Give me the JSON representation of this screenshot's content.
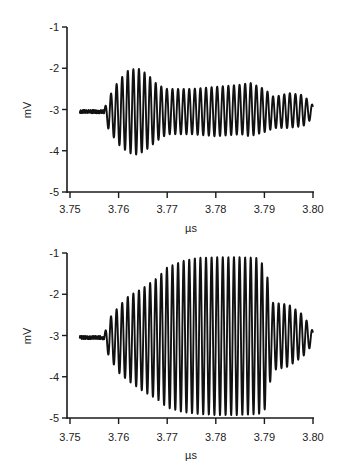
{
  "chart_data": [
    {
      "type": "line",
      "panel": "top",
      "title": "",
      "xlabel": "µs",
      "ylabel": "mV",
      "xlim": [
        3.75,
        3.8
      ],
      "ylim": [
        -5,
        -1
      ],
      "xticks": [
        "3.75",
        "3.76",
        "3.77",
        "3.78",
        "3.79",
        "3.80"
      ],
      "yticks": [
        "-1",
        "-2",
        "-3",
        "-4",
        "-5"
      ],
      "grid": false,
      "legend": null,
      "baseline_mV": -3.05,
      "signal_start_us": 3.752,
      "oscillation_start_us": 3.757,
      "signal_end_us": 3.8,
      "period_us": 0.00115,
      "envelope": {
        "t": [
          3.757,
          3.758,
          3.76,
          3.762,
          3.764,
          3.766,
          3.768,
          3.77,
          3.775,
          3.78,
          3.785,
          3.787,
          3.79,
          3.792,
          3.795,
          3.798,
          3.8
        ],
        "max": [
          -3.0,
          -2.7,
          -2.3,
          -2.05,
          -2.0,
          -2.15,
          -2.4,
          -2.5,
          -2.5,
          -2.45,
          -2.4,
          -2.35,
          -2.5,
          -2.7,
          -2.6,
          -2.65,
          -2.9
        ],
        "min": [
          -3.2,
          -3.5,
          -3.85,
          -4.05,
          -4.1,
          -3.95,
          -3.75,
          -3.6,
          -3.6,
          -3.65,
          -3.6,
          -3.65,
          -3.55,
          -3.45,
          -3.45,
          -3.4,
          -3.2
        ]
      }
    },
    {
      "type": "line",
      "panel": "bottom",
      "title": "",
      "xlabel": "µs",
      "ylabel": "mV",
      "xlim": [
        3.75,
        3.8
      ],
      "ylim": [
        -5,
        -1
      ],
      "xticks": [
        "3.75",
        "3.76",
        "3.77",
        "3.78",
        "3.79",
        "3.80"
      ],
      "yticks": [
        "-1",
        "-2",
        "-3",
        "-4",
        "-5"
      ],
      "grid": false,
      "legend": null,
      "baseline_mV": -3.05,
      "signal_start_us": 3.752,
      "oscillation_start_us": 3.757,
      "signal_end_us": 3.8,
      "period_us": 0.00115,
      "envelope": {
        "t": [
          3.757,
          3.758,
          3.76,
          3.762,
          3.765,
          3.768,
          3.77,
          3.773,
          3.776,
          3.78,
          3.785,
          3.789,
          3.7905,
          3.7915,
          3.795,
          3.798,
          3.8
        ],
        "max": [
          -3.0,
          -2.6,
          -2.3,
          -2.05,
          -1.85,
          -1.6,
          -1.35,
          -1.2,
          -1.12,
          -1.1,
          -1.1,
          -1.12,
          -1.5,
          -2.2,
          -2.25,
          -2.5,
          -2.9
        ],
        "min": [
          -3.2,
          -3.5,
          -3.9,
          -4.1,
          -4.35,
          -4.55,
          -4.75,
          -4.85,
          -4.9,
          -4.93,
          -4.93,
          -4.9,
          -4.75,
          -3.85,
          -3.75,
          -3.5,
          -3.2
        ]
      }
    }
  ],
  "figure": {
    "panels": [
      {
        "id": "top",
        "plot_left": 70,
        "plot_right": 313,
        "y_top_px": 27,
        "y_bottom_px": 192,
        "axis_x_px": 67,
        "label_y": 213,
        "xlabel_y": 232
      },
      {
        "id": "bottom",
        "plot_left": 70,
        "plot_right": 313,
        "y_top_px": 253,
        "y_bottom_px": 418,
        "axis_x_px": 67,
        "label_y": 441,
        "xlabel_y": 459
      }
    ],
    "line_color": "#111111",
    "axis_color": "#1a1a1a",
    "background": "#ffffff"
  }
}
